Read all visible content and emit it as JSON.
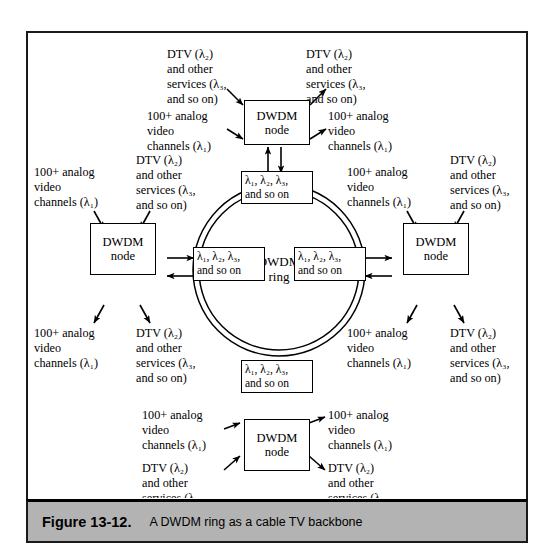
{
  "figure": {
    "number": "Figure 13-12.",
    "title": "A DWDM ring as a cable TV backbone"
  },
  "diagram": {
    "ring_label_line1": "DWDM",
    "ring_label_line2": "ring",
    "node_label_line1": "DWDM",
    "node_label_line2": "node",
    "lambda_box_line1": "λ₁, λ₂, λ₃,",
    "lambda_box_line2": "and so on",
    "analog_line1": "100+ analog",
    "analog_line2": "video",
    "analog_line3": "channels (λ₁)",
    "dtv_line1": "DTV (λ₂)",
    "dtv_line2": "and other",
    "dtv_line3": "services (λ₃,",
    "dtv_line4": "and so on)"
  },
  "colors": {
    "line": "#000000",
    "caption_bg": "#b3b3b3",
    "frame_border": "#1a1a1a",
    "page_bg": "#ffffff"
  },
  "nodes": [
    {
      "id": "top",
      "label_line1": "DWDM",
      "label_line2": "node"
    },
    {
      "id": "left",
      "label_line1": "DWDM",
      "label_line2": "node"
    },
    {
      "id": "right",
      "label_line1": "DWDM",
      "label_line2": "node"
    },
    {
      "id": "bottom",
      "label_line1": "DWDM",
      "label_line2": "node"
    }
  ]
}
